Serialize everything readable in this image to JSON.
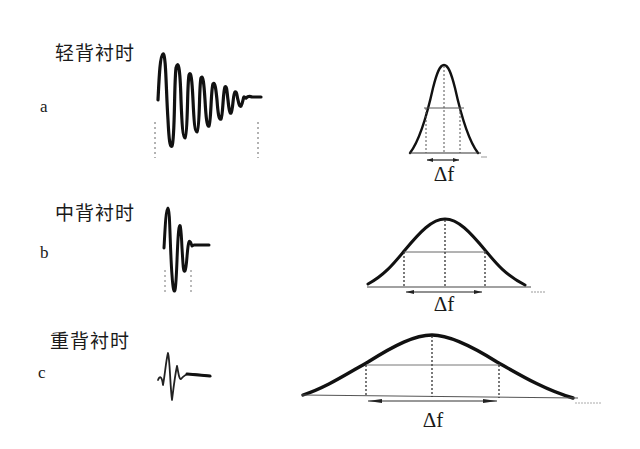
{
  "rows": [
    {
      "id": "a",
      "letter": "a",
      "condition": "轻背衬时",
      "delta_label": "Δf"
    },
    {
      "id": "b",
      "letter": "b",
      "condition": "中背衬时",
      "delta_label": "Δf"
    },
    {
      "id": "c",
      "letter": "c",
      "condition": "重背衬时",
      "delta_label": "Δf"
    }
  ],
  "colors": {
    "stroke": "#111111",
    "guide": "#555555",
    "background": "#ffffff"
  }
}
